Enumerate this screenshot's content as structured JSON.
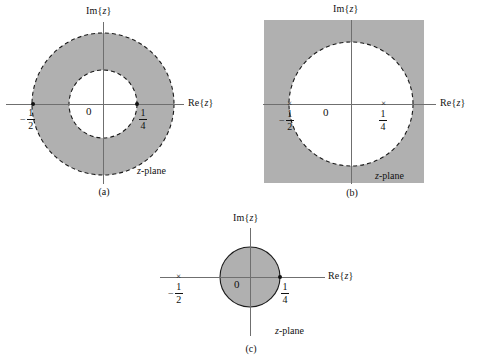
{
  "figure": {
    "title": "",
    "plane_label": "z-plane",
    "axis_real": "Re{z}",
    "axis_imag": "Im{z}",
    "origin_label": "0",
    "pole_labels": {
      "left": "-1/2",
      "right": "1/4"
    },
    "fractions": {
      "neg_half": {
        "sign": "−",
        "numerator": "1",
        "denominator": "2"
      },
      "quarter": {
        "sign": "",
        "numerator": "1",
        "denominator": "4"
      }
    },
    "colors": {
      "shade": "#b0b0b0",
      "stroke": "#1a1a1a",
      "axis": "#6f6f6f",
      "background": "#ffffff"
    }
  },
  "panels": [
    {
      "id": "a",
      "caption": "(a)",
      "region_type": "annulus",
      "region_description": "1/4 < |z| < 1/2",
      "inner_radius_value": 0.25,
      "outer_radius_value": 0.5,
      "boundary_style": "dashed",
      "plane_label": "z-plane",
      "axis_real": "Re{z}",
      "axis_imag": "Im{z}",
      "origin_label": "0",
      "markers": [
        {
          "name": "pole-neg-half",
          "glyph": "dot",
          "value": -0.5
        },
        {
          "name": "pole-quarter",
          "glyph": "dot",
          "value": 0.25
        }
      ]
    },
    {
      "id": "b",
      "caption": "(b)",
      "region_type": "exterior",
      "region_description": "|z| > 1/2",
      "radius_value": 0.5,
      "boundary_style": "dashed",
      "plane_label": "z-plane",
      "axis_real": "Re{z}",
      "axis_imag": "Im{z}",
      "origin_label": "0",
      "markers": [
        {
          "name": "pole-neg-half",
          "glyph": "x",
          "value": -0.5
        },
        {
          "name": "pole-quarter",
          "glyph": "x",
          "value": 0.25
        }
      ]
    },
    {
      "id": "c",
      "caption": "(c)",
      "region_type": "disk",
      "region_description": "|z| < 1/4",
      "radius_value": 0.25,
      "boundary_style": "solid",
      "plane_label": "z-plane",
      "axis_real": "Re{z}",
      "axis_imag": "Im{z}",
      "origin_label": "0",
      "markers": [
        {
          "name": "pole-neg-half",
          "glyph": "x",
          "value": -0.5
        },
        {
          "name": "pole-quarter",
          "glyph": "dot",
          "value": 0.25
        }
      ]
    }
  ]
}
